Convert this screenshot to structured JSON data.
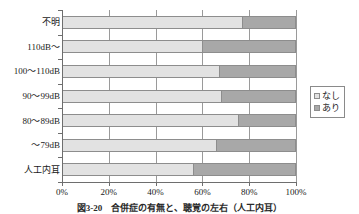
{
  "chart_data": {
    "type": "bar",
    "orientation": "horizontal",
    "stacked": "100%",
    "title": "",
    "xlabel": "",
    "ylabel": "",
    "xlim": [
      0,
      100
    ],
    "xticks": [
      "0%",
      "20%",
      "40%",
      "60%",
      "80%",
      "100%"
    ],
    "xtick_values": [
      0,
      20,
      40,
      60,
      80,
      100
    ],
    "grid": "vertical",
    "legend_position": "right",
    "categories": [
      "不明",
      "110dB～",
      "100～110dB",
      "90～99dB",
      "80～89dB",
      "～79dB",
      "人工内耳"
    ],
    "series": [
      {
        "name": "なし",
        "color": "#e2e2e2",
        "values": [
          77,
          60,
          67,
          68,
          75,
          66,
          56
        ]
      },
      {
        "name": "あり",
        "color": "#a8a8a8",
        "values": [
          23,
          40,
          33,
          32,
          25,
          34,
          44
        ]
      }
    ]
  },
  "legend": {
    "items": [
      {
        "label": "なし",
        "swatch_class": "sw-nashi"
      },
      {
        "label": "あり",
        "swatch_class": "sw-ari"
      }
    ]
  },
  "caption": {
    "text": "図3-20　合併症の有無と、聴覚の左右（人工内耳）"
  },
  "colors": {
    "series_nashi": "#e2e2e2",
    "series_ari": "#a8a8a8",
    "axis": "#6e6e6e",
    "gridline": "#9a9a9a",
    "bar_border": "#8d8d8d",
    "background": "#ffffff"
  }
}
